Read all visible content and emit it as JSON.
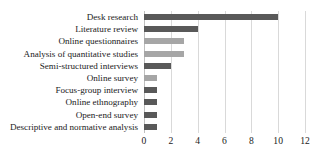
{
  "chart_data": {
    "type": "bar",
    "orientation": "horizontal",
    "title": "",
    "xlabel": "",
    "ylabel": "",
    "xlim": [
      0,
      12
    ],
    "xticks": [
      "0",
      "2",
      "4",
      "6",
      "8",
      "10",
      "12"
    ],
    "xtick_values": [
      0,
      2,
      4,
      6,
      8,
      10,
      12
    ],
    "grid": "vertical",
    "legend": "none",
    "categories": [
      "Desk research",
      "Literature review",
      "Online questionnaires",
      "Analysis of quantitative studies",
      "Semi-structured interviews",
      "Online survey",
      "Focus-group interview",
      "Online ethnography",
      "Open-end survey",
      "Descriptive and normative analysis"
    ],
    "values": [
      10,
      4,
      3,
      3,
      2,
      1,
      1,
      1,
      1,
      1
    ],
    "bar_colors": [
      "#595959",
      "#595959",
      "#a6a6a6",
      "#a6a6a6",
      "#595959",
      "#a6a6a6",
      "#595959",
      "#595959",
      "#595959",
      "#595959"
    ]
  },
  "colors": {
    "bar_dark": "#595959",
    "bar_light": "#a6a6a6",
    "gridline": "#d9d9d9",
    "axis": "#bfbfbf",
    "background": "#ffffff",
    "text": "#1a1a1a"
  }
}
